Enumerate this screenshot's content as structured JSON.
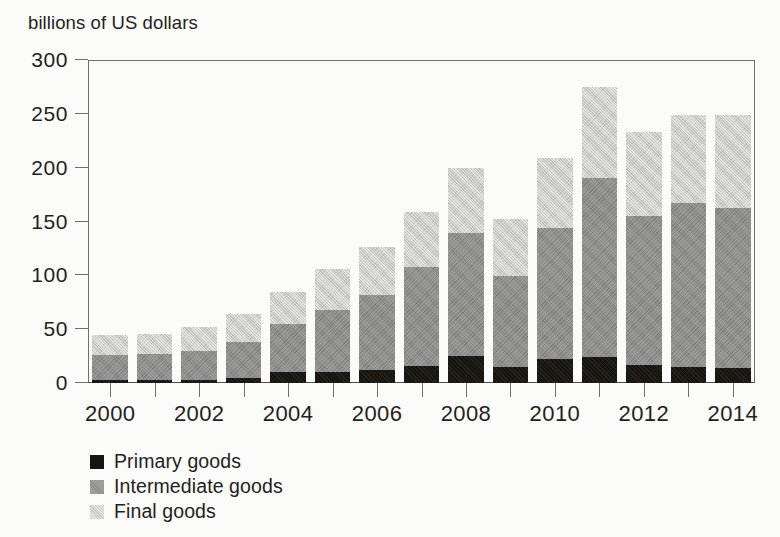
{
  "axis_caption": "billions of US dollars",
  "legend": {
    "position": "below-axis-left",
    "items": [
      {
        "key": "primary",
        "label": "Primary goods",
        "color": "#17140f"
      },
      {
        "key": "intermediate",
        "label": "Intermediate goods",
        "color": "#8d8d8b"
      },
      {
        "key": "final",
        "label": "Final goods",
        "color": "#c8c8c6"
      }
    ]
  },
  "chart_data": {
    "type": "bar",
    "stacked": true,
    "title": "",
    "subtitle": "",
    "xlabel": "",
    "ylabel": "billions of US dollars",
    "ylim": [
      0,
      300
    ],
    "yticks": [
      0,
      50,
      100,
      150,
      200,
      250,
      300
    ],
    "ytick_labels": [
      "0",
      "50",
      "100",
      "150",
      "200",
      "250",
      "300"
    ],
    "grid": false,
    "categories": [
      "2000",
      "2001",
      "2002",
      "2003",
      "2004",
      "2005",
      "2006",
      "2007",
      "2008",
      "2009",
      "2010",
      "2011",
      "2012",
      "2013",
      "2014"
    ],
    "xtick_labels": [
      "2000",
      "2002",
      "2004",
      "2006",
      "2008",
      "2010",
      "2012",
      "2014"
    ],
    "xtick_categories": [
      "2000",
      "2002",
      "2004",
      "2006",
      "2008",
      "2010",
      "2012",
      "2014"
    ],
    "series": [
      {
        "name": "Primary goods",
        "color": "#17140f",
        "values": [
          3,
          3,
          3,
          5,
          10,
          10,
          12,
          16,
          25,
          15,
          22,
          24,
          17,
          15,
          14
        ]
      },
      {
        "name": "Intermediate goods",
        "color": "#8d8d8b",
        "values": [
          23,
          24,
          27,
          33,
          45,
          58,
          70,
          92,
          114,
          84,
          122,
          166,
          138,
          152,
          149
        ]
      },
      {
        "name": "Final goods",
        "color": "#c8c8c6",
        "values": [
          19,
          19,
          22,
          26,
          30,
          38,
          44,
          51,
          61,
          53,
          65,
          85,
          78,
          82,
          86
        ]
      }
    ],
    "segment_tops": {
      "primary": [
        3,
        3,
        3,
        5,
        10,
        10,
        12,
        16,
        25,
        15,
        22,
        24,
        17,
        15,
        14
      ],
      "intermediate": [
        26,
        27,
        30,
        38,
        55,
        68,
        82,
        108,
        139,
        99,
        144,
        190,
        155,
        167,
        163
      ],
      "total": [
        45,
        46,
        52,
        64,
        85,
        106,
        126,
        159,
        200,
        152,
        209,
        275,
        233,
        249,
        249
      ]
    }
  }
}
